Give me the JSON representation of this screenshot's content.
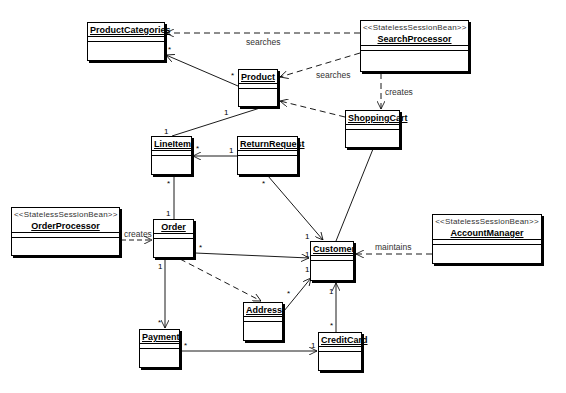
{
  "classes": {
    "product_categories": {
      "name": "ProductCategories",
      "x": 87,
      "y": 22,
      "w": 78,
      "h": 39
    },
    "product": {
      "name": "Product",
      "x": 238,
      "y": 69,
      "w": 40,
      "h": 38
    },
    "search_processor": {
      "stereotype": "<<StatelessSessionBean>>",
      "name": "SearchProcessor",
      "x": 360,
      "y": 20,
      "w": 109,
      "h": 52
    },
    "shopping_cart": {
      "name": "ShoppingCart",
      "x": 345,
      "y": 110,
      "w": 55,
      "h": 38
    },
    "line_item": {
      "name": "LineItem",
      "x": 151,
      "y": 136,
      "w": 41,
      "h": 39
    },
    "return_request": {
      "name": "ReturnRequest",
      "x": 237,
      "y": 136,
      "w": 61,
      "h": 39
    },
    "order_processor": {
      "stereotype": "<<StatelessSessionBean>>",
      "name": "OrderProcessor",
      "x": 11,
      "y": 207,
      "w": 109,
      "h": 49
    },
    "order": {
      "name": "Order",
      "x": 153,
      "y": 219,
      "w": 41,
      "h": 39
    },
    "customer": {
      "name": "Customer",
      "x": 310,
      "y": 241,
      "w": 44,
      "h": 40
    },
    "account_manager": {
      "stereotype": "<<StatelessSessionBean>>",
      "name": "AccountManager",
      "x": 432,
      "y": 214,
      "w": 110,
      "h": 50
    },
    "address": {
      "name": "Address",
      "x": 243,
      "y": 302,
      "w": 40,
      "h": 39
    },
    "payment": {
      "name": "Payment",
      "x": 139,
      "y": 329,
      "w": 41,
      "h": 39
    },
    "credit_card": {
      "name": "CreditCard",
      "x": 318,
      "y": 332,
      "w": 44,
      "h": 39
    }
  },
  "labels": {
    "searches_categories": "searches",
    "searches_product": "searches",
    "creates_cart": "creates",
    "creates_order": "creates",
    "maintains": "maintains"
  },
  "multiplicities": {
    "pc_star": "*",
    "product_star": "*",
    "product_one": "1",
    "lineitem_one_top": "1",
    "lineitem_star_right": "*",
    "rr_one": "1",
    "rr_star": "*",
    "lineitem_star_bottom": "*",
    "order_one_top": "1",
    "order_star_right": "*",
    "order_one_bottom": "1",
    "customer_one_rr": "1",
    "customer_one_order": "1",
    "customer_one_addr": "1",
    "addr_star": "*",
    "customer_one_cc": "1",
    "cc_star": "*",
    "payment_star_top": "*",
    "payment_star_right": "*",
    "cc_one_left": "1"
  }
}
